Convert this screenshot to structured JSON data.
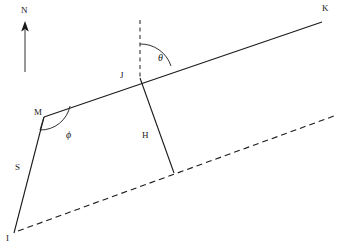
{
  "figure": {
    "type": "geometric-diagram",
    "background_color": "#ffffff",
    "line_color": "#1a1a1a",
    "width": 340,
    "height": 250
  },
  "labels": {
    "north": "N",
    "point_k": "K",
    "point_j": "J",
    "point_m": "M",
    "point_i": "I",
    "segment_s": "S",
    "segment_h": "H",
    "angle_theta": "θ",
    "angle_phi": "ϕ"
  },
  "elements": {
    "north_arrow": {
      "name": "north-arrow",
      "label": "N",
      "direction": "up",
      "x": 25,
      "y_top": 22,
      "y_bottom": 72
    },
    "line_mk": {
      "name": "solid-line-m-to-k",
      "from": "M",
      "to": "K",
      "style": "solid"
    },
    "line_ik": {
      "name": "dashed-reference-line",
      "from": "I",
      "to": "far-right",
      "style": "dashed"
    },
    "vertical_dashed": {
      "name": "vertical-dashed-line-at-j",
      "style": "dashed",
      "through": "J"
    },
    "segment_s": {
      "name": "segment-s",
      "from": "I",
      "to": "M",
      "style": "solid",
      "label": "S"
    },
    "segment_h": {
      "name": "segment-h",
      "from": "J",
      "to": "dashed-line",
      "style": "solid",
      "label": "H"
    },
    "angle_theta": {
      "name": "angle-theta",
      "label": "θ",
      "vertex": "J",
      "between": [
        "vertical-dashed-line",
        "line-jk"
      ]
    },
    "angle_phi": {
      "name": "angle-phi",
      "label": "ϕ",
      "vertex": "M",
      "between": [
        "segment-s",
        "line-mk"
      ]
    }
  },
  "coordinates": {
    "point_i": [
      14,
      233
    ],
    "point_m": [
      44,
      117
    ],
    "point_j": [
      140,
      76
    ],
    "point_k": [
      322,
      22
    ],
    "dashed_right_end": [
      334,
      116
    ],
    "h_foot": [
      174,
      173
    ]
  }
}
